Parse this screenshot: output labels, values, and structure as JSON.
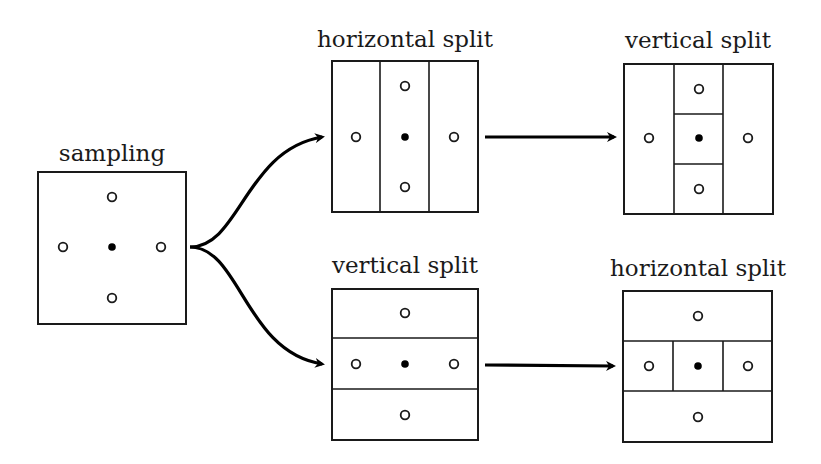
{
  "diagram": {
    "panels": {
      "sampling": {
        "label": "sampling"
      },
      "top_first": {
        "label": "horizontal split"
      },
      "top_second": {
        "label": "vertical split"
      },
      "bottom_first": {
        "label": "vertical split"
      },
      "bottom_second": {
        "label": "horizontal split"
      }
    },
    "flow": [
      [
        "sampling",
        "top_first"
      ],
      [
        "sampling",
        "bottom_first"
      ],
      [
        "top_first",
        "top_second"
      ],
      [
        "bottom_first",
        "bottom_second"
      ]
    ],
    "legend_semantics": {
      "filled_dot": "center sample point",
      "hollow_dot": "neighbor sample point"
    },
    "colors": {
      "stroke": "#1a1a1a",
      "background": "#ffffff"
    }
  }
}
